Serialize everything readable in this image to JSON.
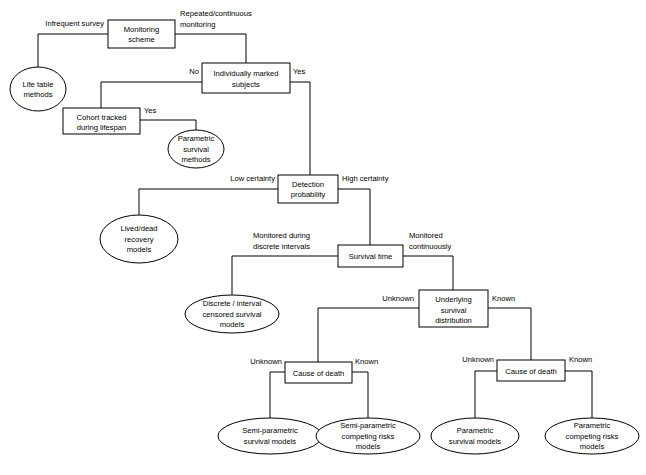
{
  "diagram": {
    "background_color": "#ffffff",
    "line_color": "#000000",
    "text_color": "#000000",
    "nodes": {
      "monitoring_scheme": {
        "line1": "Monitoring",
        "line2": "scheme",
        "shape": "rect"
      },
      "life_table": {
        "line1": "Life table",
        "line2": "methods",
        "shape": "ellipse"
      },
      "individually_marked": {
        "line1": "Individually marked",
        "line2": "subjects",
        "shape": "rect"
      },
      "cohort_tracked": {
        "line1": "Cohort tracked",
        "line2": "during lifespan",
        "shape": "rect"
      },
      "parametric_survival_methods": {
        "line1": "Parametric",
        "line2": "survival",
        "line3": "methods",
        "shape": "ellipse"
      },
      "detection_probability": {
        "line1": "Detection",
        "line2": "probability",
        "shape": "rect"
      },
      "lived_dead_recovery": {
        "line1": "Lived/dead",
        "line2": "recovery",
        "line3": "models",
        "shape": "ellipse"
      },
      "survival_time": {
        "line1": "Survival time",
        "shape": "rect"
      },
      "discrete_interval": {
        "line1": "Discrete / interval",
        "line2": "censored survival",
        "line3": "models",
        "shape": "ellipse"
      },
      "underlying_survival_distribution": {
        "line1": "Underlying",
        "line2": "survival",
        "line3": "distribution",
        "shape": "rect"
      },
      "cause_of_death_left": {
        "line1": "Cause of death",
        "shape": "rect"
      },
      "cause_of_death_right": {
        "line1": "Cause of death",
        "shape": "rect"
      },
      "semi_parametric_survival": {
        "line1": "Semi-parametric",
        "line2": "survival models",
        "shape": "ellipse"
      },
      "semi_parametric_competing": {
        "line1": "Semi-parametric",
        "line2": "competing risks",
        "line3": "models",
        "shape": "ellipse"
      },
      "parametric_survival_models": {
        "line1": "Parametric",
        "line2": "survival models",
        "shape": "ellipse"
      },
      "parametric_competing_risks": {
        "line1": "Parametric",
        "line2": "competing risks",
        "line3": "models",
        "shape": "ellipse"
      }
    },
    "edge_labels": {
      "infrequent_survey": "Infrequent survey",
      "repeated_continuous_1": "Repeated/continuous",
      "repeated_continuous_2": "monitoring",
      "no_individually_marked": "No",
      "yes_individually_marked": "Yes",
      "yes_cohort": "Yes",
      "low_certainty": "Low certainty",
      "high_certainty": "High certainty",
      "monitored_discrete_1": "Monitored during",
      "monitored_discrete_2": "discrete intervals",
      "monitored_continuously_1": "Monitored",
      "monitored_continuously_2": "continuously",
      "unknown_distribution": "Unknown",
      "known_distribution": "Known",
      "unknown_cod_left": "Unknown",
      "known_cod_left": "Known",
      "unknown_cod_right": "Unknown",
      "known_cod_right": "Known"
    }
  }
}
